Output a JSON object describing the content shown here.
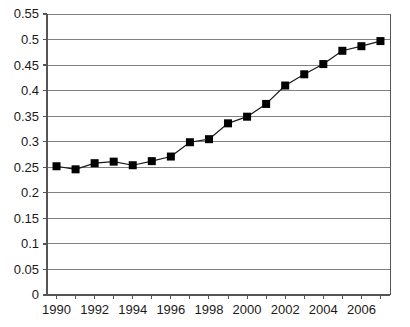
{
  "chart_data": {
    "type": "line",
    "title": "",
    "subtitle": "",
    "xlabel": "",
    "ylabel": "",
    "legend": [],
    "legend_position": "none",
    "grid": "horizontal",
    "xlim": [
      1989.5,
      2007.5
    ],
    "ylim": [
      0,
      0.55
    ],
    "ytick_labels": [
      "0",
      "0.05",
      "0.1",
      "0.15",
      "0.2",
      "0.25",
      "0.3",
      "0.35",
      "0.4",
      "0.45",
      "0.5",
      "0.55"
    ],
    "ytick_values": [
      0,
      0.05,
      0.1,
      0.15,
      0.2,
      0.25,
      0.3,
      0.35,
      0.4,
      0.45,
      0.5,
      0.55
    ],
    "xtick_labels": [
      "1990",
      "1992",
      "1994",
      "1996",
      "1998",
      "2000",
      "2002",
      "2004",
      "2006"
    ],
    "xtick_values": [
      1990,
      1992,
      1994,
      1996,
      1998,
      2000,
      2002,
      2004,
      2006
    ],
    "xtick_minor_values": [
      1991,
      1993,
      1995,
      1997,
      1999,
      2001,
      2003,
      2005,
      2007
    ],
    "x": [
      1990,
      1991,
      1992,
      1993,
      1994,
      1995,
      1996,
      1997,
      1998,
      1999,
      2000,
      2001,
      2002,
      2003,
      2004,
      2005,
      2006,
      2007
    ],
    "values": [
      0.252,
      0.246,
      0.258,
      0.261,
      0.254,
      0.262,
      0.271,
      0.299,
      0.305,
      0.336,
      0.349,
      0.374,
      0.41,
      0.432,
      0.452,
      0.478,
      0.487,
      0.497
    ],
    "series": [
      {
        "name": "series-1",
        "marker": "square",
        "marker_color": "#000000",
        "line_color": "#1a1a1a",
        "values": [
          0.252,
          0.246,
          0.258,
          0.261,
          0.254,
          0.262,
          0.271,
          0.299,
          0.305,
          0.336,
          0.349,
          0.374,
          0.41,
          0.432,
          0.452,
          0.478,
          0.487,
          0.497
        ]
      }
    ],
    "colors": {
      "grid": "#808080",
      "axis": "#555555",
      "line": "#1a1a1a",
      "marker": "#000000",
      "background": "#ffffff",
      "text": "#1a1a1a"
    }
  }
}
